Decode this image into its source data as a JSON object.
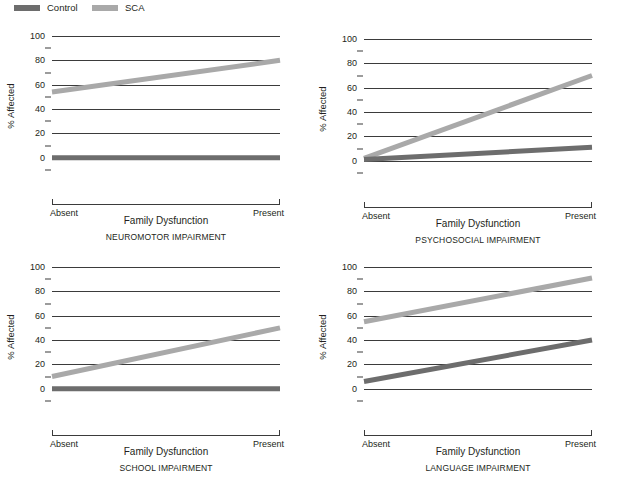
{
  "legend": {
    "items": [
      {
        "label": "Control",
        "color": "#6d6d6d",
        "icon": "legend-swatch-icon"
      },
      {
        "label": "SCA",
        "color": "#a9a9a9",
        "icon": "legend-swatch-icon"
      }
    ]
  },
  "axis": {
    "ylabel": "% Affected",
    "yticks": [
      0,
      20,
      40,
      60,
      80,
      100
    ],
    "yminor": [
      10,
      30,
      50,
      70,
      90,
      -10
    ],
    "ylim": [
      -15,
      100
    ],
    "xlabel": "Family Dysfunction",
    "xcategories": [
      "Absent",
      "Present"
    ]
  },
  "chart_data": {
    "type": "line",
    "title": "",
    "xlabel": "Family Dysfunction",
    "ylabel": "% Affected",
    "ylim": [
      0,
      100
    ],
    "grid": true,
    "legend_position": "top-left",
    "x": [
      "Absent",
      "Present"
    ],
    "panels": [
      {
        "title": "NEUROMOTOR IMPAIRMENT",
        "xlabel": "Family Dysfunction",
        "series": [
          {
            "name": "Control",
            "values": [
              0,
              0
            ],
            "color": "#6d6d6d"
          },
          {
            "name": "SCA",
            "values": [
              54,
              80
            ],
            "color": "#a9a9a9"
          }
        ]
      },
      {
        "title": "PSYCHOSOCIAL IMPAIRMENT",
        "xlabel": "Family Dysfunction",
        "series": [
          {
            "name": "Control",
            "values": [
              1,
              11
            ],
            "color": "#6d6d6d"
          },
          {
            "name": "SCA",
            "values": [
              2,
              70
            ],
            "color": "#a9a9a9"
          }
        ]
      },
      {
        "title": "SCHOOL IMPAIRMENT",
        "xlabel": "Family Dysfunction",
        "series": [
          {
            "name": "Control",
            "values": [
              0,
              0
            ],
            "color": "#6d6d6d"
          },
          {
            "name": "SCA",
            "values": [
              10,
              50
            ],
            "color": "#a9a9a9"
          }
        ]
      },
      {
        "title": "LANGUAGE IMPAIRMENT",
        "xlabel": "Family Dysfunction",
        "series": [
          {
            "name": "Control",
            "values": [
              6,
              40
            ],
            "color": "#6d6d6d"
          },
          {
            "name": "SCA",
            "values": [
              55,
              91
            ],
            "color": "#a9a9a9"
          }
        ]
      }
    ]
  }
}
